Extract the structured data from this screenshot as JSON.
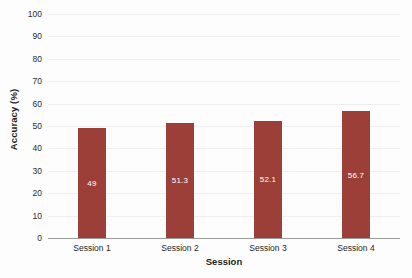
{
  "chart_data": {
    "type": "bar",
    "title": "",
    "categories": [
      "Session 1",
      "Session 2",
      "Session 3",
      "Session 4"
    ],
    "values": [
      49,
      51.3,
      52.1,
      56.7
    ],
    "data_labels": [
      "49",
      "51.3",
      "52.1",
      "56.7"
    ],
    "xlabel": "Session",
    "ylabel": "Accuracy (%)",
    "ylim": [
      0,
      100
    ],
    "yticks": [
      0,
      10,
      20,
      30,
      40,
      50,
      60,
      70,
      80,
      90,
      100
    ],
    "ytick_labels": [
      "0",
      "10",
      "20",
      "30",
      "40",
      "50",
      "60",
      "70",
      "80",
      "90",
      "100"
    ],
    "grid": true,
    "legend": false,
    "series_color": "#9c3f38",
    "data_label_color": "#ffffff",
    "gridline_color": "#f0eeee",
    "axis_color": "#9a9a9a",
    "background_color": "#fdfdfd"
  }
}
